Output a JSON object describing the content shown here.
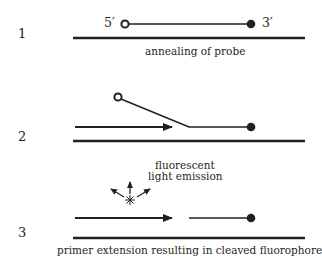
{
  "diagram": {
    "type": "taqman-probe-mechanism",
    "colors": {
      "line": "#231f20",
      "background": "#ffffff"
    },
    "steps": [
      {
        "number": "1",
        "caption": "annealing of probe",
        "labels": {
          "five_prime": "5′",
          "three_prime": "3′"
        },
        "elements": [
          "template-strand",
          "probe-with-open-circle-5-prime",
          "filled-circle-3-prime"
        ]
      },
      {
        "number": "2",
        "caption": "fluorescent light emission",
        "caption_lines": [
          "fluorescent",
          "light emission"
        ],
        "elements": [
          "template-strand",
          "primer-extension-arrow",
          "displaced-probe-flap",
          "filled-circle-3-prime"
        ]
      },
      {
        "number": "3",
        "caption": "primer extension resulting in cleaved fluorophore",
        "elements": [
          "template-strand",
          "primer-extension-arrow",
          "probe-fragment",
          "filled-circle-3-prime",
          "emission-star",
          "light-arrows"
        ]
      }
    ]
  }
}
